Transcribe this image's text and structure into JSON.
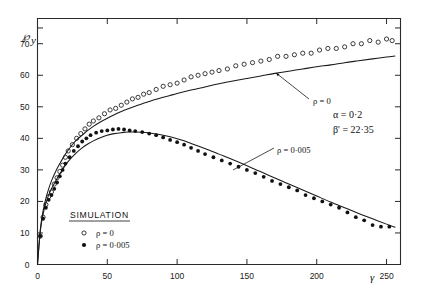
{
  "chart_data": {
    "type": "scatter",
    "title": "",
    "xlabel": "γ",
    "ylabel": "℘y",
    "xlim": [
      0,
      260
    ],
    "ylim": [
      0,
      78
    ],
    "xticks": [
      0,
      50,
      100,
      150,
      200,
      250
    ],
    "xtick_labels": [
      "0",
      "50",
      "100",
      "150",
      "200",
      "250"
    ],
    "yticks": [
      0,
      10,
      20,
      30,
      40,
      50,
      60,
      70
    ],
    "ytick_labels": [
      "0",
      "10",
      "20",
      "30",
      "40",
      "50",
      "60",
      "70"
    ],
    "minor_yticks": [
      75
    ],
    "grid": false,
    "legend_position": "lower-center-left",
    "legend_title": "SIMULATION",
    "annotations": [
      {
        "name": "alpha-parameter",
        "text": "α = 0·0"
      },
      {
        "name": "beta-parameter",
        "text": "β' = 22·35"
      },
      {
        "name": "upper-curve-callout",
        "text": "ρ = 0"
      },
      {
        "name": "lower-curve-callout",
        "text": "ρ = 0·005"
      }
    ],
    "alpha_label": "α",
    "alpha_value": "0·2",
    "beta_label": "β'",
    "beta_value": "22·35",
    "series": [
      {
        "name": "ρ = 0",
        "marker": "open-circle",
        "callout": "ρ = 0",
        "points": [
          [
            2,
            9
          ],
          [
            4,
            15
          ],
          [
            6,
            19
          ],
          [
            8,
            21.5
          ],
          [
            10,
            23
          ],
          [
            12,
            25.5
          ],
          [
            14,
            27.5
          ],
          [
            16,
            29.5
          ],
          [
            18,
            31.5
          ],
          [
            20,
            34
          ],
          [
            22,
            36
          ],
          [
            25,
            38
          ],
          [
            28,
            40
          ],
          [
            31,
            41.5
          ],
          [
            34,
            43
          ],
          [
            37,
            44.5
          ],
          [
            40,
            45.5
          ],
          [
            44,
            46.5
          ],
          [
            48,
            47.8
          ],
          [
            52,
            49
          ],
          [
            56,
            49.5
          ],
          [
            60,
            50.5
          ],
          [
            64,
            51.5
          ],
          [
            68,
            52.5
          ],
          [
            72,
            53
          ],
          [
            76,
            54
          ],
          [
            80,
            54.5
          ],
          [
            85,
            55.5
          ],
          [
            90,
            56.5
          ],
          [
            95,
            57
          ],
          [
            100,
            57.5
          ],
          [
            105,
            58.5
          ],
          [
            110,
            59.5
          ],
          [
            115,
            60
          ],
          [
            120,
            60.5
          ],
          [
            125,
            61
          ],
          [
            130,
            61.5
          ],
          [
            136,
            62
          ],
          [
            142,
            63
          ],
          [
            148,
            63.5
          ],
          [
            154,
            64
          ],
          [
            160,
            64.5
          ],
          [
            166,
            65
          ],
          [
            172,
            66
          ],
          [
            178,
            66
          ],
          [
            184,
            66.5
          ],
          [
            190,
            67
          ],
          [
            196,
            67
          ],
          [
            202,
            68
          ],
          [
            208,
            68.5
          ],
          [
            214,
            68.5
          ],
          [
            220,
            69
          ],
          [
            226,
            70
          ],
          [
            232,
            70
          ],
          [
            238,
            71
          ],
          [
            244,
            70.5
          ],
          [
            250,
            71.5
          ],
          [
            254,
            71
          ]
        ],
        "curve": [
          [
            0,
            0
          ],
          [
            2,
            11
          ],
          [
            4,
            17
          ],
          [
            6,
            21
          ],
          [
            8,
            24
          ],
          [
            10,
            26.5
          ],
          [
            13,
            29.5
          ],
          [
            16,
            32
          ],
          [
            20,
            35
          ],
          [
            24,
            37.5
          ],
          [
            28,
            39.5
          ],
          [
            32,
            41
          ],
          [
            36,
            42.5
          ],
          [
            40,
            43.8
          ],
          [
            45,
            45.2
          ],
          [
            50,
            46.4
          ],
          [
            55,
            47.5
          ],
          [
            60,
            48.5
          ],
          [
            65,
            49.4
          ],
          [
            70,
            50.2
          ],
          [
            75,
            51
          ],
          [
            80,
            51.7
          ],
          [
            85,
            52.4
          ],
          [
            90,
            53
          ],
          [
            95,
            53.6
          ],
          [
            100,
            54.2
          ],
          [
            110,
            55.3
          ],
          [
            120,
            56.3
          ],
          [
            130,
            57.3
          ],
          [
            140,
            58.2
          ],
          [
            150,
            59
          ],
          [
            160,
            59.8
          ],
          [
            170,
            60.6
          ],
          [
            180,
            61.3
          ],
          [
            190,
            62
          ],
          [
            200,
            62.7
          ],
          [
            210,
            63.3
          ],
          [
            220,
            64
          ],
          [
            230,
            64.6
          ],
          [
            240,
            65.2
          ],
          [
            250,
            65.8
          ],
          [
            256,
            66.1
          ]
        ]
      },
      {
        "name": "ρ = 0·005",
        "marker": "filled-circle",
        "callout": "ρ = 0·005",
        "points": [
          [
            2,
            9
          ],
          [
            4,
            14.5
          ],
          [
            6,
            18
          ],
          [
            8,
            20.5
          ],
          [
            10,
            22
          ],
          [
            12,
            24
          ],
          [
            14,
            26
          ],
          [
            16,
            28
          ],
          [
            18,
            30
          ],
          [
            20,
            32
          ],
          [
            23,
            34
          ],
          [
            26,
            36
          ],
          [
            29,
            37.5
          ],
          [
            32,
            39
          ],
          [
            35,
            40
          ],
          [
            38,
            41
          ],
          [
            42,
            41.8
          ],
          [
            46,
            42.3
          ],
          [
            50,
            42.5
          ],
          [
            54,
            42.8
          ],
          [
            58,
            43
          ],
          [
            62,
            42.8
          ],
          [
            66,
            42.5
          ],
          [
            70,
            42.3
          ],
          [
            75,
            42
          ],
          [
            80,
            41.5
          ],
          [
            85,
            41
          ],
          [
            90,
            40.3
          ],
          [
            95,
            39.5
          ],
          [
            100,
            38.8
          ],
          [
            105,
            38
          ],
          [
            110,
            37
          ],
          [
            115,
            36
          ],
          [
            120,
            35
          ],
          [
            126,
            34
          ],
          [
            132,
            33
          ],
          [
            138,
            32
          ],
          [
            144,
            31
          ],
          [
            150,
            30
          ],
          [
            156,
            29
          ],
          [
            162,
            27.8
          ],
          [
            168,
            26.5
          ],
          [
            174,
            25.5
          ],
          [
            180,
            24.5
          ],
          [
            186,
            23.5
          ],
          [
            192,
            22
          ],
          [
            198,
            21
          ],
          [
            204,
            20
          ],
          [
            210,
            19
          ],
          [
            216,
            18
          ],
          [
            222,
            16.5
          ],
          [
            228,
            15
          ],
          [
            234,
            14
          ],
          [
            240,
            12.5
          ],
          [
            246,
            12
          ],
          [
            252,
            12
          ]
        ],
        "curve": [
          [
            0,
            0
          ],
          [
            2,
            10.5
          ],
          [
            4,
            16
          ],
          [
            6,
            19.5
          ],
          [
            8,
            22
          ],
          [
            10,
            24
          ],
          [
            13,
            26.5
          ],
          [
            16,
            28.8
          ],
          [
            20,
            31.5
          ],
          [
            24,
            33.7
          ],
          [
            28,
            35.5
          ],
          [
            32,
            37
          ],
          [
            36,
            38.2
          ],
          [
            40,
            39.2
          ],
          [
            45,
            40.2
          ],
          [
            50,
            41
          ],
          [
            55,
            41.5
          ],
          [
            60,
            41.8
          ],
          [
            65,
            42
          ],
          [
            70,
            42
          ],
          [
            75,
            41.9
          ],
          [
            80,
            41.7
          ],
          [
            85,
            41.4
          ],
          [
            90,
            41
          ],
          [
            95,
            40.5
          ],
          [
            100,
            39.9
          ],
          [
            105,
            39.2
          ],
          [
            110,
            38.4
          ],
          [
            115,
            37.6
          ],
          [
            120,
            36.8
          ],
          [
            130,
            35
          ],
          [
            140,
            33.2
          ],
          [
            150,
            31.3
          ],
          [
            160,
            29.4
          ],
          [
            170,
            27.4
          ],
          [
            180,
            25.5
          ],
          [
            190,
            23.6
          ],
          [
            200,
            21.7
          ],
          [
            210,
            19.8
          ],
          [
            220,
            18
          ],
          [
            230,
            16.2
          ],
          [
            240,
            14.5
          ],
          [
            250,
            12.8
          ],
          [
            256,
            11.8
          ]
        ]
      }
    ]
  },
  "legend": {
    "title": "SIMULATION",
    "entries": [
      {
        "marker": "open-circle",
        "label": "ρ = 0"
      },
      {
        "marker": "filled-circle",
        "label": "ρ = 0·005"
      }
    ]
  },
  "axes": {
    "y_title": "℘",
    "y_title_sub": "y",
    "x_title": "γ"
  }
}
